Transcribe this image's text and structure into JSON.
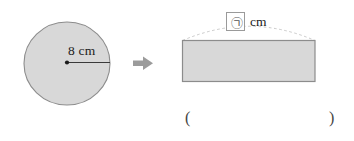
{
  "figure": {
    "colors": {
      "shape_fill": "#d8d8d8",
      "shape_stroke": "#8c8c8c",
      "arrow": "#9b9b9b",
      "dashed_arc": "#bdbdbd",
      "text": "#1b1b1b",
      "box_border": "#9a9a9a",
      "background": "#ffffff"
    }
  },
  "circle": {
    "name": "circle-shape",
    "radius_label": "8 cm",
    "radius_value": 8,
    "unit": "cm",
    "center_dot": true
  },
  "arrow": {
    "name": "transform-arrow",
    "direction": "right",
    "glyph": "arrow-right-icon"
  },
  "rectangle": {
    "name": "rectangle-shape",
    "top_length_label": "cm",
    "answer_symbol": "㉠",
    "unit": "cm"
  },
  "answer": {
    "paren_open": "(",
    "paren_close": ")",
    "value": ""
  }
}
